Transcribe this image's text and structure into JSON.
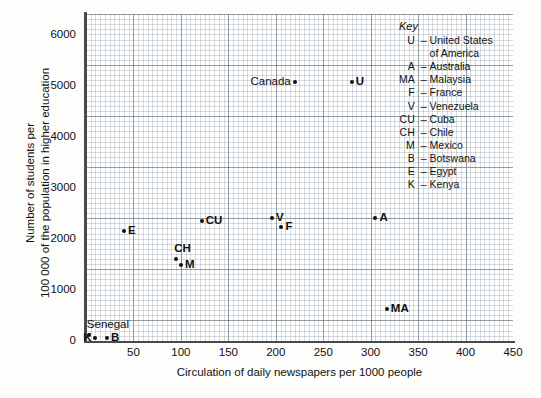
{
  "chart_data": {
    "type": "scatter",
    "title": "",
    "xlabel": "Circulation of daily newspapers per 1000 people",
    "ylabel_line1": "Number of students per",
    "ylabel_line2": "100 000 of the population in higher education",
    "xlim": [
      0,
      450
    ],
    "ylim": [
      0,
      6400
    ],
    "xticks": [
      "0",
      "50",
      "100",
      "150",
      "200",
      "250",
      "300",
      "350",
      "400",
      "450"
    ],
    "yticks": [
      "0",
      "1000",
      "2000",
      "3000",
      "4000",
      "5000",
      "6000"
    ],
    "grid": "major and minor graph-paper grid",
    "legend_position": "inside top-right",
    "points": [
      {
        "label": "Senegal",
        "x": 3,
        "y": 120,
        "label_pos": "above"
      },
      {
        "label": "K",
        "x": 10,
        "y": 60,
        "label_pos": "left"
      },
      {
        "label": "B",
        "x": 22,
        "y": 60,
        "label_pos": "right"
      },
      {
        "label": "E",
        "x": 40,
        "y": 2150,
        "label_pos": "right"
      },
      {
        "label": "CH",
        "x": 95,
        "y": 1600,
        "label_pos": "above"
      },
      {
        "label": "M",
        "x": 100,
        "y": 1480,
        "label_pos": "right"
      },
      {
        "label": "CU",
        "x": 122,
        "y": 2350,
        "label_pos": "right"
      },
      {
        "label": "V",
        "x": 196,
        "y": 2400,
        "label_pos": "right"
      },
      {
        "label": "F",
        "x": 206,
        "y": 2240,
        "label_pos": "right"
      },
      {
        "label": "Canada",
        "x": 220,
        "y": 5070,
        "label_pos": "left"
      },
      {
        "label": "U",
        "x": 280,
        "y": 5070,
        "label_pos": "right"
      },
      {
        "label": "A",
        "x": 305,
        "y": 2400,
        "label_pos": "right"
      },
      {
        "label": "MA",
        "x": 317,
        "y": 620,
        "label_pos": "right"
      }
    ]
  },
  "key": {
    "title": "Key",
    "entries": [
      {
        "abbr": "U",
        "dash": "–",
        "name": "United States",
        "name2": "of America"
      },
      {
        "abbr": "A",
        "dash": "–",
        "name": "Australia"
      },
      {
        "abbr": "MA",
        "dash": "–",
        "name": "Malaysia"
      },
      {
        "abbr": "F",
        "dash": "–",
        "name": "France"
      },
      {
        "abbr": "V",
        "dash": "–",
        "name": "Venezuela"
      },
      {
        "abbr": "CU",
        "dash": "–",
        "name": "Cuba"
      },
      {
        "abbr": "CH",
        "dash": "–",
        "name": "Chile"
      },
      {
        "abbr": "M",
        "dash": "–",
        "name": "Mexico"
      },
      {
        "abbr": "B",
        "dash": "–",
        "name": "Botswana"
      },
      {
        "abbr": "E",
        "dash": "–",
        "name": "Egypt"
      },
      {
        "abbr": "K",
        "dash": "–",
        "name": "Kenya"
      }
    ]
  },
  "colors": {
    "point": "#111111",
    "axis": "#4a4a4a",
    "grid_major": "#5a6973",
    "grid_minor": "#788c96",
    "background": "#fdfdfb",
    "plot_background": "#ffffff"
  }
}
